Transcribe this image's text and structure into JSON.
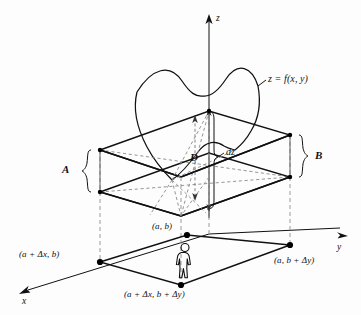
{
  "figure": {
    "background_color": "#fdfdfd",
    "line_color": "#111111",
    "dashed_color": "#8a8a8a"
  },
  "axes": {
    "z_label": "z",
    "y_label": "y",
    "x_label": "x"
  },
  "surface": {
    "label": "z = f(x, y)"
  },
  "measures": {
    "a_label": "A",
    "b_label": "B",
    "d_label": "D",
    "dz_label": "dz"
  },
  "points": {
    "origin_corner": "(a, b)",
    "x_corner": "(a + Δx, b)",
    "y_corner": "(a, b + Δy)",
    "far_corner": "(a + Δx, b + Δy)"
  },
  "figure_icon": {
    "person": "standing-person"
  }
}
